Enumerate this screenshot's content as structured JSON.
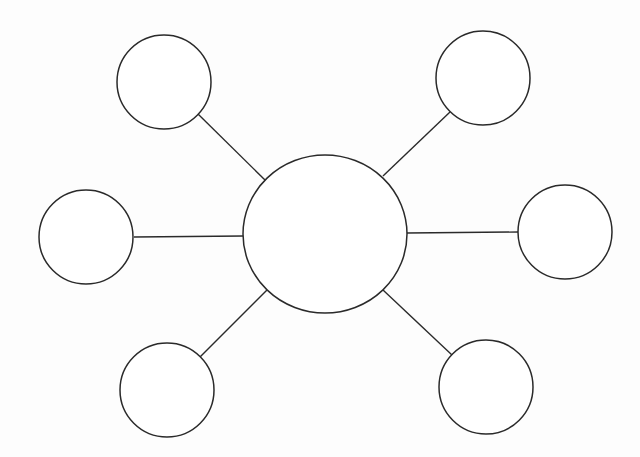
{
  "diagram": {
    "type": "spider-map",
    "stroke_color": "#2a2a2a",
    "fill_color": "#ffffff",
    "background": "#fdfdfd",
    "center": {
      "cx": 325,
      "cy": 234,
      "rx": 82,
      "ry": 79,
      "label": ""
    },
    "nodes": [
      {
        "id": "top-left",
        "cx": 164,
        "cy": 82,
        "r": 47,
        "label": ""
      },
      {
        "id": "top-right",
        "cx": 483,
        "cy": 78,
        "r": 47,
        "label": ""
      },
      {
        "id": "left",
        "cx": 86,
        "cy": 237,
        "r": 47,
        "label": ""
      },
      {
        "id": "right",
        "cx": 565,
        "cy": 232,
        "r": 47,
        "label": ""
      },
      {
        "id": "bottom-left",
        "cx": 167,
        "cy": 390,
        "r": 47,
        "label": ""
      },
      {
        "id": "bottom-right",
        "cx": 486,
        "cy": 387,
        "r": 47,
        "label": ""
      }
    ],
    "edges": [
      {
        "from": "center",
        "to": "top-left",
        "x1": 265,
        "y1": 180,
        "x2": 198,
        "y2": 114
      },
      {
        "from": "center",
        "to": "top-right",
        "x1": 383,
        "y1": 176,
        "x2": 450,
        "y2": 112
      },
      {
        "from": "center",
        "to": "left",
        "x1": 243,
        "y1": 236,
        "x2": 134,
        "y2": 237
      },
      {
        "from": "center",
        "to": "right",
        "x1": 407,
        "y1": 233,
        "x2": 518,
        "y2": 232
      },
      {
        "from": "center",
        "to": "bottom-left",
        "x1": 267,
        "y1": 290,
        "x2": 200,
        "y2": 357
      },
      {
        "from": "center",
        "to": "bottom-right",
        "x1": 383,
        "y1": 290,
        "x2": 452,
        "y2": 355
      }
    ]
  }
}
